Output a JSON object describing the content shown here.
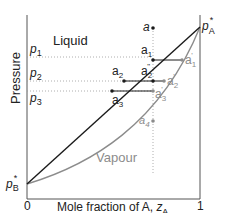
{
  "diagram": {
    "type": "phase-diagram",
    "y_axis_label": "Pressure",
    "x_axis_label": "Mole fraction of A, ",
    "x_axis_var": "z",
    "x_axis_var_sub": "A",
    "x_tick_0": "0",
    "x_tick_1": "1",
    "region_liquid": "Liquid",
    "region_vapour": "Vapour",
    "pA_star": {
      "base": "p",
      "sub": "A",
      "sup": "*"
    },
    "pB_star": {
      "base": "p",
      "sub": "B",
      "sup": "*"
    },
    "pressure_levels": [
      {
        "base": "p",
        "sub": "1"
      },
      {
        "base": "p",
        "sub": "2"
      },
      {
        "base": "p",
        "sub": "3"
      }
    ],
    "points": {
      "a": "a",
      "a1": {
        "base": "a",
        "sub": "1"
      },
      "a2": {
        "base": "a",
        "sub": "2"
      },
      "a2pp": {
        "base": "a",
        "sub": "2",
        "sup": "\""
      },
      "a3": {
        "base": "a",
        "sub": "3"
      },
      "a1p": {
        "base": "a",
        "sub": "1",
        "sup": "'"
      },
      "a2p": {
        "base": "a",
        "sub": "2",
        "sup": "'"
      },
      "a3p": {
        "base": "a",
        "sub": "3",
        "sup": "'"
      },
      "a4": {
        "base": "a",
        "sub": "4"
      }
    },
    "colors": {
      "liquid_line": "#1a1a1a",
      "vapour_curve": "#8c8c8c",
      "axis": "#555555",
      "dotted": "#999999",
      "grey_text": "#8c8c8c"
    }
  }
}
